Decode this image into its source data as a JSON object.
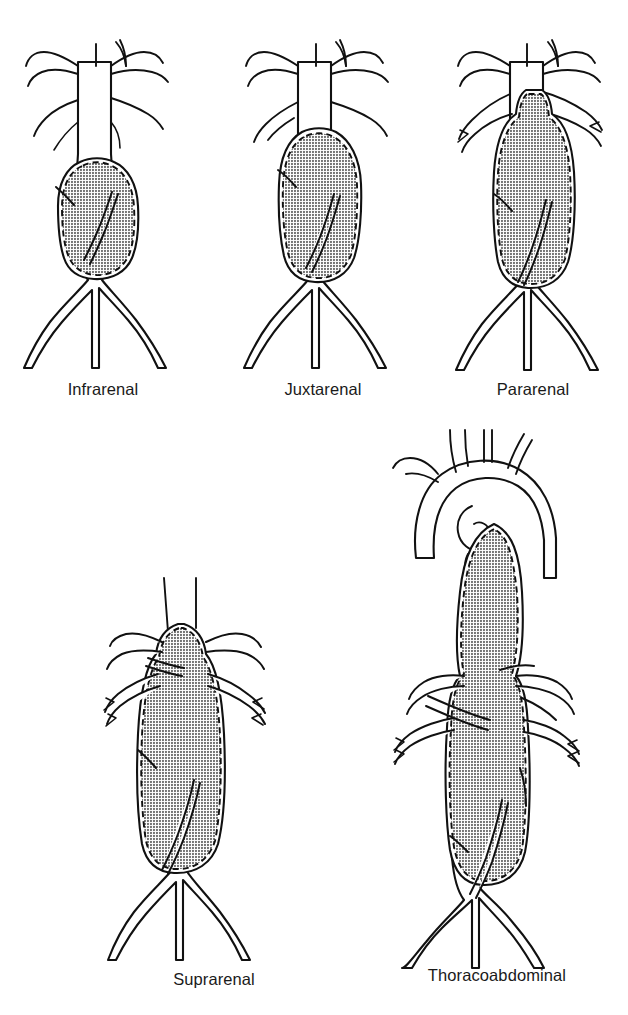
{
  "figure": {
    "background_color": "#ffffff",
    "line_color": "#111111",
    "aneurysm_fill_color": "#8a8a8a",
    "aneurysm_outline_style": "dashed",
    "panel_count": 5
  },
  "panels": [
    {
      "id": "infrarenal",
      "label": "Infrarenal",
      "row": 1,
      "column": 1,
      "description": "Aneurysm sac begins below the renal arteries; normal infrarenal neck present."
    },
    {
      "id": "juxtarenal",
      "label": "Juxtarenal",
      "row": 1,
      "column": 2,
      "description": "Aneurysm sac reaches the level of the renal arteries with no infrarenal neck."
    },
    {
      "id": "pararenal",
      "label": "Pararenal",
      "row": 1,
      "column": 3,
      "description": "Aneurysm sac involves the renal artery origins and extends just above them."
    },
    {
      "id": "suprarenal",
      "label": "Suprarenal",
      "row": 2,
      "column": 1,
      "description": "Aneurysm sac extends above the renal arteries to involve the visceral segment."
    },
    {
      "id": "thoracoabdominal",
      "label": "Thoracoabdominal",
      "row": 2,
      "column": 2,
      "description": "Aneurysm extends from the descending thoracic aorta through the visceral segment to the aortic bifurcation."
    }
  ],
  "anatomy": {
    "structures": [
      "aortic arch",
      "brachiocephalic trunk",
      "left common carotid artery",
      "left subclavian artery",
      "descending thoracic aorta",
      "celiac artery",
      "superior mesenteric artery",
      "renal arteries",
      "abdominal aorta",
      "inferior mesenteric artery",
      "aortic bifurcation",
      "common iliac arteries",
      "internal iliac arteries",
      "external iliac arteries"
    ]
  }
}
